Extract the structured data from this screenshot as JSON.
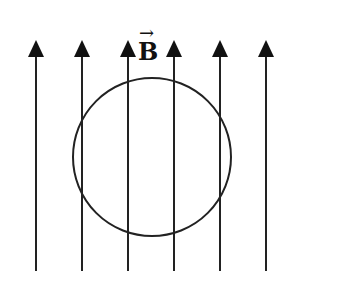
{
  "diagram": {
    "field_label": "B",
    "field_label_vector_arrow": "→",
    "field_direction": "up",
    "field_lines_x": [
      36,
      82,
      128,
      174,
      220,
      266
    ],
    "field_line_top": 40,
    "field_line_bottom": 271,
    "loop": {
      "shape": "circle",
      "cx": 152,
      "cy": 157,
      "r": 79
    },
    "stroke_color": "#222222"
  }
}
